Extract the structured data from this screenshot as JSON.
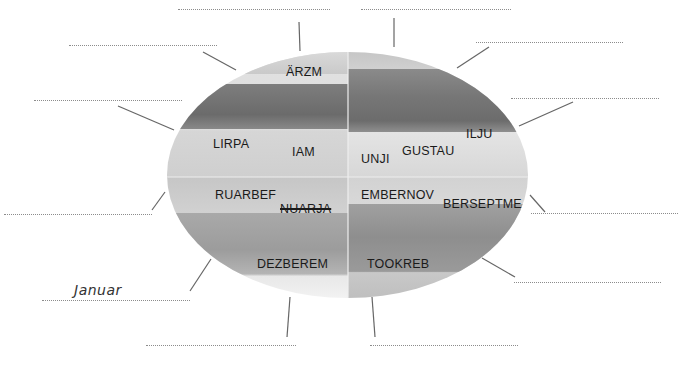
{
  "worksheet": {
    "colors": {
      "text": "#1a1a1a",
      "blank_line": "#8c8c8c",
      "connector": "#666666",
      "handwritten": "#333333"
    },
    "quadrants": {
      "spring": {
        "words": [
          "ÄRZM",
          "LIRPA",
          "IAM"
        ]
      },
      "summer": {
        "words": [
          "UNJI",
          "GUSTAU",
          "ILJU"
        ]
      },
      "winter": {
        "words": [
          "RUARBEF",
          "NUARJA",
          "DEZBEREM"
        ],
        "struck": "NUARJA"
      },
      "autumn": {
        "words": [
          "EMBERNOV",
          "BERSEPTME",
          "TOOKREB"
        ]
      }
    },
    "answers": {
      "blank_1": "",
      "blank_2": "",
      "blank_3": "",
      "blank_4": "",
      "blank_5": "",
      "blank_6": "",
      "blank_7": "",
      "blank_8": "",
      "blank_9": "",
      "blank_10": "",
      "blank_11": "",
      "blank_12": "Januar"
    }
  }
}
